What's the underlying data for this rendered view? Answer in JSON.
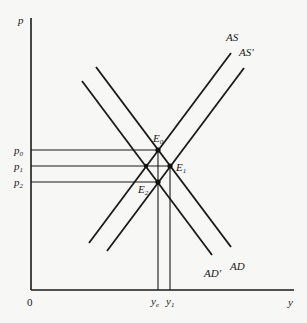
{
  "diagram": {
    "type": "AS-AD economics diagram",
    "axes": {
      "y_label": "p",
      "x_label": "y",
      "origin_label": "0"
    },
    "price_levels": [
      {
        "base": "p",
        "sub": "0"
      },
      {
        "base": "p",
        "sub": "1"
      },
      {
        "base": "p",
        "sub": "2"
      }
    ],
    "output_levels": [
      {
        "base": "y",
        "sub": "e"
      },
      {
        "base": "y",
        "sub": "1"
      }
    ],
    "curves": {
      "as": "AS",
      "as_prime": "AS'",
      "ad": "AD",
      "ad_prime": "AD'"
    },
    "equilibria": [
      {
        "base": "E",
        "sub": "0"
      },
      {
        "base": "E",
        "sub": "1"
      },
      {
        "base": "E",
        "sub": "2"
      }
    ]
  }
}
